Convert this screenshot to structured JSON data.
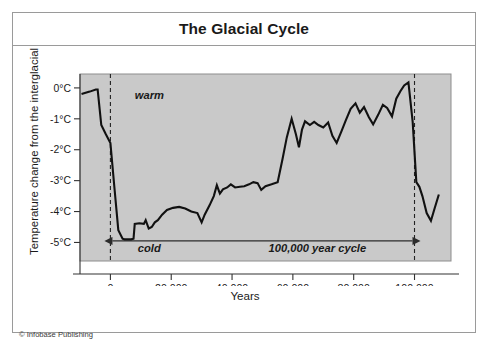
{
  "figure": {
    "title": "The Glacial Cycle",
    "credit": "© Infobase Publishing"
  },
  "chart_data": {
    "type": "line",
    "title": "The Glacial Cycle",
    "xlabel": "Years",
    "ylabel": "Temperature change from the interglacial",
    "xlim": [
      -10000,
      112000
    ],
    "ylim": [
      -5.6,
      0.45
    ],
    "grid": false,
    "legend": null,
    "x_ticks": [
      0,
      20000,
      40000,
      60000,
      80000,
      100000
    ],
    "x_tick_labels": [
      "0",
      "20,000",
      "40,000",
      "60,000",
      "80,000",
      "100,000"
    ],
    "y_ticks": [
      0,
      -1,
      -2,
      -3,
      -4,
      -5
    ],
    "y_tick_labels": [
      "0°C",
      "-1°C",
      "-2°C",
      "-3°C",
      "-4°C",
      "-5°C"
    ],
    "plot_background": "#c9c9c9",
    "line_color": "#111111",
    "annotations": [
      {
        "text": "warm",
        "x": 8000,
        "y": -0.35,
        "style": "italic-bold"
      },
      {
        "text": "cold",
        "x": 9000,
        "y": -5.3,
        "style": "italic-bold"
      },
      {
        "text": "100,000 year cycle",
        "x": 52000,
        "y": -5.3,
        "style": "italic-bold"
      }
    ],
    "vertical_markers": [
      {
        "x": 0,
        "style": "dashed"
      },
      {
        "x": 100000,
        "style": "dashed"
      }
    ],
    "span_arrow": {
      "from": 0,
      "to": 100000,
      "y": -4.95,
      "label": "100,000 year cycle",
      "double_headed": true
    },
    "series": [
      {
        "name": "Temperature change from the interglacial",
        "x": [
          -9500,
          -6800,
          -4800,
          -4200,
          -3000,
          -1500,
          0,
          1200,
          2600,
          4000,
          4600,
          6800,
          7600,
          8000,
          9500,
          11000,
          11600,
          12600,
          13600,
          14600,
          15600,
          17000,
          18600,
          20600,
          22600,
          24600,
          26600,
          28600,
          30000,
          31000,
          32600,
          34000,
          35000,
          36000,
          37000,
          38400,
          39600,
          41000,
          42600,
          44000,
          45600,
          47000,
          48400,
          49600,
          51000,
          53000,
          55000,
          56600,
          58000,
          59600,
          61000,
          62000,
          63000,
          64000,
          65600,
          67000,
          68400,
          70000,
          71600,
          73000,
          74400,
          76000,
          77400,
          79000,
          80600,
          82000,
          83400,
          85000,
          86400,
          88000,
          89600,
          91000,
          92600,
          94000,
          95400,
          96600,
          98000,
          99400,
          100600,
          101600,
          102600,
          104000,
          105400,
          106600,
          108000
        ],
        "y": [
          -0.2,
          -0.12,
          -0.05,
          -0.05,
          -1.2,
          -1.5,
          -1.78,
          -3.1,
          -4.6,
          -4.88,
          -4.9,
          -4.9,
          -4.88,
          -4.4,
          -4.38,
          -4.4,
          -4.28,
          -4.55,
          -4.5,
          -4.35,
          -4.28,
          -4.1,
          -3.95,
          -3.88,
          -3.85,
          -3.9,
          -4.0,
          -4.05,
          -4.35,
          -4.1,
          -3.8,
          -3.5,
          -3.15,
          -3.42,
          -3.28,
          -3.22,
          -3.12,
          -3.22,
          -3.2,
          -3.18,
          -3.12,
          -3.05,
          -3.08,
          -3.3,
          -3.18,
          -3.12,
          -3.05,
          -2.3,
          -1.6,
          -1.0,
          -1.5,
          -1.92,
          -1.35,
          -1.08,
          -1.2,
          -1.1,
          -1.2,
          -1.28,
          -1.12,
          -1.55,
          -1.78,
          -1.4,
          -1.05,
          -0.68,
          -0.5,
          -0.8,
          -0.62,
          -0.95,
          -1.18,
          -0.88,
          -0.55,
          -0.65,
          -0.92,
          -0.35,
          -0.1,
          0.08,
          0.18,
          -1.1,
          -3.05,
          -3.2,
          -3.5,
          -4.05,
          -4.3,
          -3.9,
          -3.45
        ]
      }
    ]
  }
}
